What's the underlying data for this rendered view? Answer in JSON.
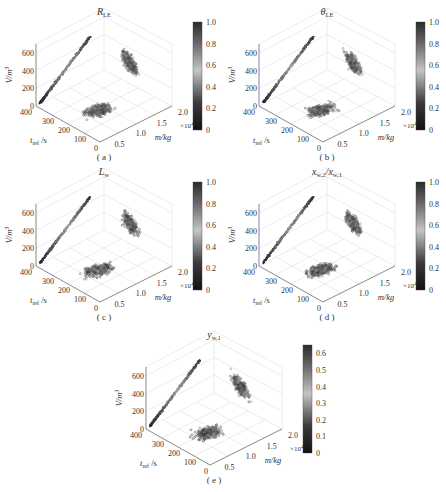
{
  "figure": {
    "panels": [
      {
        "id": "a",
        "caption": "( a )",
        "title": "R",
        "title_sub": "LE",
        "cbar_ticks": [
          "0",
          "0.2",
          "0.4",
          "0.6",
          "0.8",
          "1.0"
        ],
        "cbar_max": 1.0
      },
      {
        "id": "b",
        "caption": "( b )",
        "title": "θ",
        "title_sub": "LE",
        "cbar_ticks": [
          "0",
          "0.2",
          "0.4",
          "0.6",
          "0.8",
          "1.0"
        ],
        "cbar_max": 1.0
      },
      {
        "id": "c",
        "caption": "( c )",
        "title": "L",
        "title_sub": "w",
        "cbar_ticks": [
          "0",
          "0.2",
          "0.4",
          "0.6",
          "0.8",
          "1.0"
        ],
        "cbar_max": 1.0
      },
      {
        "id": "d",
        "caption": "( d )",
        "title": "x",
        "title_sub": "w,2",
        "title_mid": "/x",
        "title_sub2": "w,1",
        "cbar_ticks": [
          "0",
          "0.2",
          "0.4",
          "0.6",
          "0.8",
          "1.0"
        ],
        "cbar_max": 1.0
      },
      {
        "id": "e",
        "caption": "( e )",
        "title": "y",
        "title_sub": "w,1",
        "cbar_ticks": [
          "0",
          "0.1",
          "0.2",
          "0.3",
          "0.4",
          "0.5",
          "0.6"
        ],
        "cbar_max": 0.65
      }
    ],
    "axes": {
      "z_label": "V/m",
      "z_label_sup": "3",
      "z_ticks": [
        "0",
        "200",
        "400",
        "600"
      ],
      "y_label": "t",
      "y_label_sub": "ref",
      "y_label_unit": " /s",
      "y_ticks": [
        "400",
        "300",
        "200",
        "100",
        "0"
      ],
      "x_label": "m/kg",
      "x_ticks": [
        "0.5",
        "1.0",
        "1.5",
        "2.0"
      ],
      "x_multiplier": "×10",
      "x_multiplier_exp": "4"
    }
  },
  "chart_data": [
    {
      "type": "scatter",
      "title": "R_LE",
      "subplot": "a",
      "xlabel": "m/kg (×10^4)",
      "ylabel": "t_ref /s",
      "zlabel": "V/m^3",
      "xlim": [
        0.3,
        2.0
      ],
      "ylim": [
        0,
        400
      ],
      "zlim": [
        0,
        700
      ],
      "colorbar": {
        "range": [
          0,
          1.0
        ],
        "ticks": [
          0,
          0.2,
          0.4,
          0.6,
          0.8,
          1.0
        ],
        "colormap": "gray"
      },
      "projections": [
        "V vs t_ref (linear band, V≈100→700 as t_ref 400→~250)",
        "V vs m (cluster m 0.8–1.8, V 300–650)",
        "t_ref vs m (cluster m 0.7–1.8, t_ref 100–350)"
      ]
    },
    {
      "type": "scatter",
      "title": "θ_LE",
      "subplot": "b",
      "xlabel": "m/kg (×10^4)",
      "ylabel": "t_ref /s",
      "zlabel": "V/m^3",
      "xlim": [
        0.3,
        2.0
      ],
      "ylim": [
        0,
        400
      ],
      "zlim": [
        0,
        700
      ],
      "colorbar": {
        "range": [
          0,
          1.0
        ],
        "ticks": [
          0,
          0.2,
          0.4,
          0.6,
          0.8,
          1.0
        ],
        "colormap": "gray"
      }
    },
    {
      "type": "scatter",
      "title": "L_w",
      "subplot": "c",
      "xlabel": "m/kg (×10^4)",
      "ylabel": "t_ref /s",
      "zlabel": "V/m^3",
      "xlim": [
        0.3,
        2.0
      ],
      "ylim": [
        0,
        400
      ],
      "zlim": [
        0,
        700
      ],
      "colorbar": {
        "range": [
          0,
          1.0
        ],
        "ticks": [
          0,
          0.2,
          0.4,
          0.6,
          0.8,
          1.0
        ],
        "colormap": "gray"
      }
    },
    {
      "type": "scatter",
      "title": "x_w,2/x_w,1",
      "subplot": "d",
      "xlabel": "m/kg (×10^4)",
      "ylabel": "t_ref /s",
      "zlabel": "V/m^3",
      "xlim": [
        0.3,
        2.0
      ],
      "ylim": [
        0,
        400
      ],
      "zlim": [
        0,
        700
      ],
      "colorbar": {
        "range": [
          0,
          1.0
        ],
        "ticks": [
          0,
          0.2,
          0.4,
          0.6,
          0.8,
          1.0
        ],
        "colormap": "gray"
      }
    },
    {
      "type": "scatter",
      "title": "y_w,1",
      "subplot": "e",
      "xlabel": "m/kg (×10^4)",
      "ylabel": "t_ref /s",
      "zlabel": "V/m^3",
      "xlim": [
        0.3,
        2.0
      ],
      "ylim": [
        0,
        400
      ],
      "zlim": [
        0,
        700
      ],
      "colorbar": {
        "range": [
          0,
          0.65
        ],
        "ticks": [
          0,
          0.1,
          0.2,
          0.3,
          0.4,
          0.5,
          0.6
        ],
        "colormap": "gray"
      }
    }
  ]
}
